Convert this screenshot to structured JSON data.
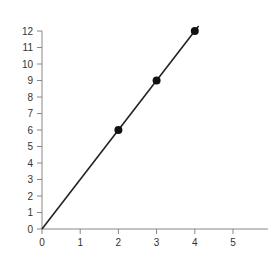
{
  "chart_data": {
    "type": "line",
    "title": "",
    "xlabel": "",
    "ylabel": "",
    "x_ticks": [
      "0",
      "1",
      "2",
      "3",
      "4",
      "5"
    ],
    "y_ticks": [
      "0",
      "1",
      "2",
      "3",
      "4",
      "5",
      "6",
      "7",
      "8",
      "9",
      "10",
      "11",
      "12"
    ],
    "xlim": [
      0,
      5.9
    ],
    "ylim": [
      0,
      12
    ],
    "grid": false,
    "legend": null,
    "series": [
      {
        "name": "line",
        "style": "line",
        "x": [
          0,
          4.1
        ],
        "y": [
          0,
          12.3
        ]
      },
      {
        "name": "points",
        "style": "markers",
        "x": [
          2,
          3,
          4
        ],
        "y": [
          6,
          9,
          12
        ]
      }
    ],
    "colors": {
      "line": "#222222",
      "marker": "#111111",
      "axis": "#888888",
      "text": "#333333"
    }
  }
}
